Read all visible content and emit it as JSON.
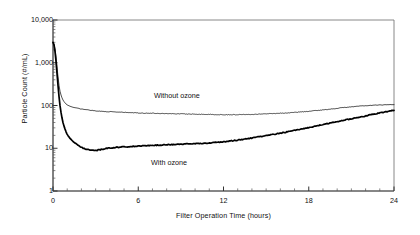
{
  "chart_data": {
    "type": "line",
    "title": "",
    "xlabel": "Filter Operation Time (hours)",
    "ylabel": "Particle Count (#/mL)",
    "yscale": "log",
    "xlim": [
      0,
      24
    ],
    "ylim": [
      1,
      10000
    ],
    "grid": false,
    "legend_position": "inline-annotations",
    "ytick_labels": [
      "10,000",
      "1,000",
      "100",
      "10",
      "1"
    ],
    "ytick_values": [
      10000,
      1000,
      100,
      10,
      1
    ],
    "xtick_labels": [
      "0",
      "6",
      "12",
      "18",
      "24"
    ],
    "xtick_values": [
      0,
      6,
      12,
      18,
      24
    ],
    "x_minor_tick_interval": 1,
    "annotations": [
      {
        "text": "Without ozone",
        "x": 7.1,
        "y": 170
      },
      {
        "text": "With ozone",
        "x": 6.9,
        "y": 4.6
      }
    ],
    "series": [
      {
        "name": "Without ozone",
        "label": "Without ozone",
        "color": "#000000",
        "line_width": 0.7,
        "x": [
          0,
          0.1,
          0.2,
          0.3,
          0.4,
          0.5,
          0.6,
          0.7,
          0.8,
          0.9,
          1.0,
          1.2,
          1.4,
          1.6,
          1.8,
          2.0,
          2.3,
          2.6,
          3.0,
          3.4,
          3.8,
          4.2,
          4.6,
          5.0,
          5.5,
          6.0,
          6.5,
          7.0,
          7.5,
          8.0,
          8.5,
          9.0,
          9.5,
          10.0,
          10.5,
          11.0,
          11.5,
          12.0,
          12.5,
          13.0,
          13.5,
          14.0,
          14.5,
          15.0,
          15.5,
          16.0,
          16.5,
          17.0,
          17.5,
          18.0,
          18.5,
          19.0,
          19.5,
          20.0,
          20.5,
          21.0,
          21.5,
          22.0,
          22.5,
          23.0,
          23.5,
          24.0
        ],
        "y": [
          3000,
          2600,
          1500,
          700,
          330,
          210,
          160,
          135,
          120,
          110,
          103,
          96,
          91,
          88,
          85,
          83,
          80,
          78,
          75,
          73,
          72,
          71,
          70,
          69,
          68,
          67,
          66,
          66,
          65,
          65,
          64,
          64,
          63,
          63,
          62,
          62,
          61,
          61,
          61,
          61,
          62,
          62,
          63,
          64,
          65,
          66,
          67,
          69,
          71,
          73,
          76,
          79,
          82,
          86,
          90,
          93,
          96,
          99,
          101,
          103,
          104,
          105
        ]
      },
      {
        "name": "With ozone",
        "label": "With ozone",
        "color": "#000000",
        "line_width": 1.7,
        "x": [
          0,
          0.1,
          0.2,
          0.3,
          0.4,
          0.5,
          0.6,
          0.7,
          0.8,
          0.9,
          1.0,
          1.2,
          1.4,
          1.6,
          1.8,
          2.0,
          2.3,
          2.6,
          3.0,
          3.4,
          3.8,
          4.2,
          4.6,
          5.0,
          5.5,
          6.0,
          6.5,
          7.0,
          7.5,
          8.0,
          8.5,
          9.0,
          9.5,
          10.0,
          10.5,
          11.0,
          11.5,
          12.0,
          12.5,
          13.0,
          13.5,
          14.0,
          14.5,
          15.0,
          15.5,
          16.0,
          16.5,
          17.0,
          17.5,
          18.0,
          18.5,
          19.0,
          19.5,
          20.0,
          20.5,
          21.0,
          21.5,
          22.0,
          22.5,
          23.0,
          23.5,
          24.0
        ],
        "y": [
          3000,
          2500,
          1200,
          480,
          190,
          95,
          58,
          40,
          31,
          25,
          21,
          17,
          14.5,
          12.8,
          11.5,
          10.5,
          9.6,
          9.1,
          8.8,
          9.4,
          10.0,
          10.3,
          10.6,
          10.8,
          11.0,
          11.2,
          11.4,
          11.7,
          11.9,
          12.1,
          12.3,
          12.5,
          12.6,
          12.8,
          13.0,
          13.3,
          13.7,
          14.1,
          14.8,
          15.5,
          16.4,
          17.4,
          18.5,
          19.7,
          21.0,
          22.5,
          24.2,
          26.1,
          28.2,
          30.5,
          33.0,
          35.8,
          38.8,
          42.0,
          45.5,
          49.0,
          53.0,
          57.0,
          62.0,
          67.0,
          72.0,
          78.0
        ]
      }
    ]
  },
  "plot_geometry": {
    "left": 53,
    "right": 394,
    "top": 20,
    "bottom": 191
  }
}
